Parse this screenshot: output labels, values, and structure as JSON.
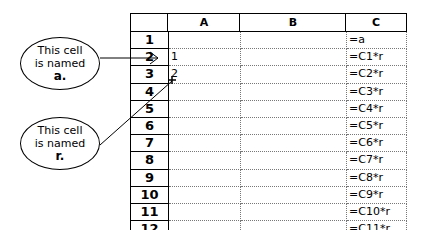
{
  "callouts": [
    {
      "line1": "This cell",
      "line2": "is named",
      "name": "a."
    },
    {
      "line1": "This cell",
      "line2": "is named",
      "name": "r."
    }
  ],
  "columns": [
    "",
    "A",
    "B",
    "C"
  ],
  "rows": [
    {
      "num": "1",
      "A": "",
      "B": "",
      "C": "=a"
    },
    {
      "num": "2",
      "A": "1",
      "B": "",
      "C": "=C1*r"
    },
    {
      "num": "3",
      "A": "2",
      "B": "",
      "C": "=C2*r"
    },
    {
      "num": "4",
      "A": "",
      "B": "",
      "C": "=C3*r"
    },
    {
      "num": "5",
      "A": "",
      "B": "",
      "C": "=C4*r"
    },
    {
      "num": "6",
      "A": "",
      "B": "",
      "C": "=C5*r"
    },
    {
      "num": "7",
      "A": "",
      "B": "",
      "C": "=C6*r"
    },
    {
      "num": "8",
      "A": "",
      "B": "",
      "C": "=C7*r"
    },
    {
      "num": "9",
      "A": "",
      "B": "",
      "C": "=C8*r"
    },
    {
      "num": "10",
      "A": "",
      "B": "",
      "C": "=C9*r"
    },
    {
      "num": "11",
      "A": "",
      "B": "",
      "C": "=C10*r"
    },
    {
      "num": "12",
      "A": "",
      "B": "",
      "C": "=C11*r"
    }
  ]
}
